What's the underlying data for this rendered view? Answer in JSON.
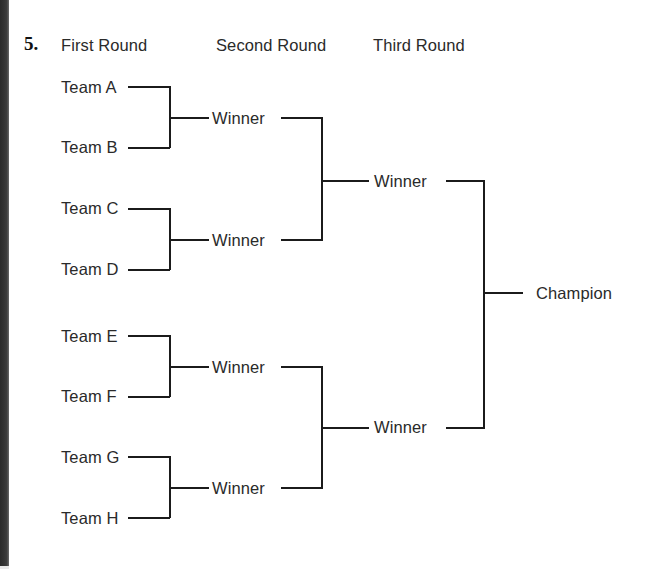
{
  "page": {
    "question_number": "5.",
    "width": 652,
    "height": 569,
    "background_color": "#ffffff",
    "line_color": "#1b1b1b",
    "text_color": "#2a2a2a"
  },
  "headers": [
    {
      "label": "First Round"
    },
    {
      "label": "Second Round"
    },
    {
      "label": "Third Round"
    }
  ],
  "bracket": {
    "round1": [
      {
        "label": "Team A"
      },
      {
        "label": "Team B"
      },
      {
        "label": "Team C"
      },
      {
        "label": "Team D"
      },
      {
        "label": "Team E"
      },
      {
        "label": "Team F"
      },
      {
        "label": "Team G"
      },
      {
        "label": "Team H"
      }
    ],
    "round2": [
      {
        "label": "Winner"
      },
      {
        "label": "Winner"
      },
      {
        "label": "Winner"
      },
      {
        "label": "Winner"
      }
    ],
    "round3": [
      {
        "label": "Winner"
      },
      {
        "label": "Winner"
      }
    ],
    "final": [
      {
        "label": "Champion"
      }
    ]
  }
}
